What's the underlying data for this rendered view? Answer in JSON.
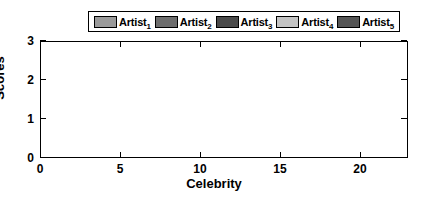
{
  "chart_data": {
    "type": "bar",
    "title": "",
    "xlabel": "Celebrity",
    "ylabel": "Scores",
    "stacked": true,
    "grid": false,
    "legend_position": "top",
    "xlim": [
      0,
      23
    ],
    "ylim": [
      0,
      3
    ],
    "ytick_labels": [
      "0",
      "1",
      "2",
      "3"
    ],
    "ytick_values": [
      0,
      1,
      2,
      3
    ],
    "xtick_labels": [
      "0",
      "5",
      "10",
      "15",
      "20"
    ],
    "xtick_values": [
      0,
      5,
      10,
      15,
      20
    ],
    "categories": [
      1,
      2,
      3,
      4,
      5,
      6,
      7,
      8,
      9,
      10,
      11,
      12,
      13,
      14,
      15,
      16,
      17,
      18,
      19,
      20,
      21,
      22
    ],
    "series": [
      {
        "name": "Artist_1",
        "label": "Artist",
        "sub": "1",
        "color": "#9a9a9a",
        "values": [
          0.5,
          0.28,
          0.33,
          0.52,
          0.52,
          0.3,
          0.32,
          0.35,
          0.52,
          0.52,
          0.3,
          0.26,
          0.45,
          0.52,
          0.3,
          0.52,
          0.48,
          0.55,
          0.3,
          0.42,
          0.58,
          0.6
        ]
      },
      {
        "name": "Artist_2",
        "label": "Artist",
        "sub": "2",
        "color": "#6d6d6d",
        "values": [
          0.9,
          0.85,
          0.55,
          0.4,
          0.45,
          0.75,
          0.55,
          0.5,
          0.38,
          0.4,
          0.4,
          0.4,
          0.52,
          0.6,
          0.55,
          0.62,
          0.7,
          0.55,
          0.6,
          0.45,
          0.7,
          0.6
        ]
      },
      {
        "name": "Artist_3",
        "label": "Artist",
        "sub": "3",
        "color": "#4a4a4a",
        "values": [
          0.15,
          0.3,
          0.5,
          0.3,
          0.35,
          0.45,
          0.45,
          0.3,
          0.48,
          0.3,
          0.35,
          0.28,
          0.38,
          0.45,
          0.35,
          0.55,
          0.6,
          0.45,
          0.4,
          0.48,
          0.5,
          0.45
        ]
      },
      {
        "name": "Artist_4",
        "label": "Artist",
        "sub": "4",
        "color": "#c4c4c4",
        "values": [
          0.3,
          0.6,
          0.35,
          0.3,
          0.42,
          0.45,
          0.4,
          0.45,
          0.3,
          0.25,
          0.25,
          0.3,
          0.4,
          0.35,
          0.35,
          0.4,
          0.45,
          0.35,
          0.48,
          0.4,
          0.45,
          0.55
        ]
      },
      {
        "name": "Artist_5",
        "label": "Artist",
        "sub": "5",
        "color": "#545454",
        "values": [
          0.35,
          0.35,
          0.45,
          0.53,
          0.35,
          0.72,
          0.48,
          0.5,
          0.42,
          0.35,
          0.3,
          0.36,
          0.45,
          0.38,
          0.45,
          0.51,
          0.48,
          0.42,
          0.42,
          0.45,
          0.52,
          0.6
        ]
      }
    ]
  }
}
